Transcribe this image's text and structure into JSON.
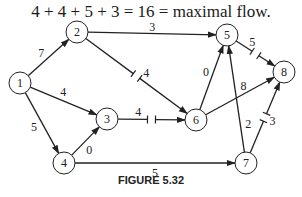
{
  "title": "4 + 4 + 5 + 3 = 16 = maximal flow.",
  "caption": "FIGURE 5.32",
  "nodes": [
    {
      "id": "1",
      "x": 20,
      "y": 83
    },
    {
      "id": "2",
      "x": 77,
      "y": 32
    },
    {
      "id": "3",
      "x": 107,
      "y": 119
    },
    {
      "id": "4",
      "x": 64,
      "y": 163
    },
    {
      "id": "5",
      "x": 227,
      "y": 35
    },
    {
      "id": "6",
      "x": 196,
      "y": 120
    },
    {
      "id": "7",
      "x": 246,
      "y": 163
    },
    {
      "id": "8",
      "x": 284,
      "y": 72
    }
  ],
  "edges": [
    {
      "from": "1",
      "to": "2",
      "label": "7",
      "cut": false
    },
    {
      "from": "1",
      "to": "3",
      "label": "4",
      "cut": false
    },
    {
      "from": "1",
      "to": "4",
      "label": "5",
      "cut": false
    },
    {
      "from": "2",
      "to": "5",
      "label": "3",
      "cut": false
    },
    {
      "from": "2",
      "to": "6",
      "label": "4",
      "cut": true
    },
    {
      "from": "3",
      "to": "6",
      "label": "4",
      "cut": true
    },
    {
      "from": "4",
      "to": "3",
      "label": "0",
      "cut": false
    },
    {
      "from": "4",
      "to": "7",
      "label": "5",
      "cut": false
    },
    {
      "from": "6",
      "to": "5",
      "label": "0",
      "cut": false
    },
    {
      "from": "6",
      "to": "8",
      "label": "8",
      "cut": false
    },
    {
      "from": "7",
      "to": "5",
      "label": "2",
      "cut": false
    },
    {
      "from": "5",
      "to": "8",
      "label": "5",
      "cut": true
    },
    {
      "from": "7",
      "to": "8",
      "label": "3",
      "cut": true
    }
  ],
  "node_radius": 11
}
